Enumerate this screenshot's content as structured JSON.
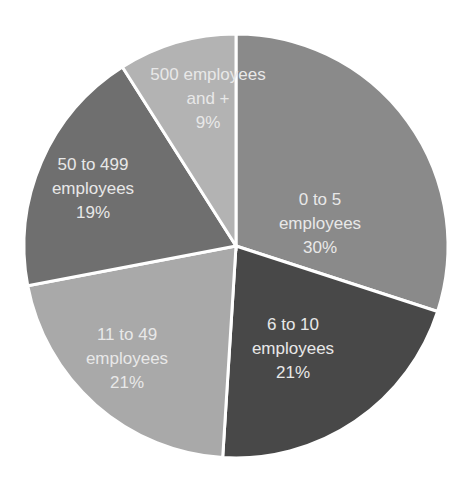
{
  "chart_data": {
    "type": "pie",
    "title": "",
    "categories": [
      "0 to 5 employees",
      "6 to 10 employees",
      "11 to 49 employees",
      "50 to 499 employees",
      "500 employees and +"
    ],
    "values": [
      30,
      21,
      21,
      19,
      9
    ],
    "unit": "%",
    "colors": [
      "#8a8a8a",
      "#484848",
      "#a9a9a9",
      "#6f6f6f",
      "#b3b3b3"
    ],
    "labels": [
      [
        "0 to 5",
        "employees",
        "30%"
      ],
      [
        "6 to 10",
        "employees",
        "21%"
      ],
      [
        "11 to 49",
        "employees",
        "21%"
      ],
      [
        "50 to 499",
        "employees",
        "19%"
      ],
      [
        "500 employees",
        "and +",
        "9%"
      ]
    ],
    "legend": "none (data labels inside slices)"
  }
}
